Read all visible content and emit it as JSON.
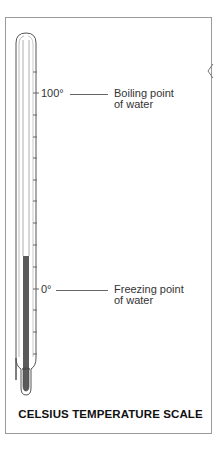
{
  "diagram": {
    "title": "CELSIUS TEMPERATURE SCALE",
    "markers": [
      {
        "value_label": "100°",
        "description_line1": "Boiling point",
        "description_line2": "of water"
      },
      {
        "value_label": "0°",
        "description_line1": "Freezing point",
        "description_line2": "of water"
      }
    ],
    "thermometer": {
      "tick_count": 14,
      "mercury_color": "#5a5a5a",
      "outline_color": "#555555"
    }
  }
}
